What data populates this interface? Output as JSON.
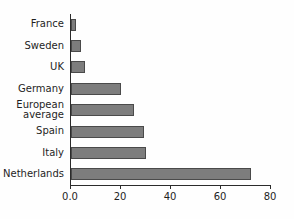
{
  "chart_data": {
    "type": "bar",
    "orientation": "horizontal",
    "title": "",
    "xlabel": "",
    "ylabel": "",
    "categories": [
      "France",
      "Sweden",
      "UK",
      "Germany",
      "European\naverage",
      "Spain",
      "Italy",
      "Netherlands"
    ],
    "values": [
      2,
      4,
      5.5,
      20,
      25,
      29,
      30,
      72
    ],
    "xlim": [
      0,
      80
    ],
    "xticks": [
      0,
      20,
      40,
      60,
      80
    ],
    "xtick_labels": [
      "0.0",
      "20",
      "40",
      "60",
      "80"
    ],
    "grid": false,
    "legend": null,
    "bar_color": "#7d7d7d",
    "bar_edge_color": "#4a4a4a",
    "background_color": "#ffffff",
    "axis_color": "#2b2b2b",
    "text_color": "#1f1f1f"
  }
}
